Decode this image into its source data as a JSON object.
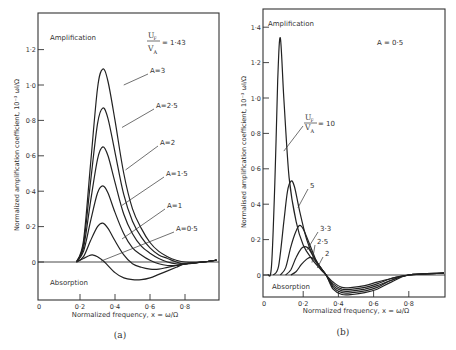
{
  "chart_data": [
    {
      "type": "line",
      "panel_label": "(a)",
      "title": "",
      "xlabel": "Normalized frequency,  x = ω/Ω",
      "ylabel": "Normalized amplification coefficient,  10⁻³ ωI/Ω",
      "xlim": [
        0,
        1.0
      ],
      "ylim": [
        -0.12,
        1.3
      ],
      "xticks": [
        {
          "v": 0,
          "label": "0"
        },
        {
          "v": 0.2,
          "label": "0·2"
        },
        {
          "v": 0.4,
          "label": "0·4"
        },
        {
          "v": 0.6,
          "label": "0·6"
        },
        {
          "v": 0.8,
          "label": "0·8"
        }
      ],
      "yticks": [
        {
          "v": 0,
          "label": "0"
        },
        {
          "v": 0.2,
          "label": "0·2"
        },
        {
          "v": 0.4,
          "label": "0·4"
        },
        {
          "v": 0.6,
          "label": "0·6"
        },
        {
          "v": 0.8,
          "label": "0·8"
        },
        {
          "v": 1.0,
          "label": "1·0"
        },
        {
          "v": 1.2,
          "label": "1·2"
        }
      ],
      "annotations": {
        "top": "Amplification",
        "bottom": "Absorption",
        "param_num": "U",
        "param_num_sub": "F",
        "param_den": "V",
        "param_den_sub": "A",
        "param_value": "= 1·43"
      },
      "series": [
        {
          "name": "A = 3",
          "label": "A=3",
          "peak": 1.09,
          "peak_x": 0.33,
          "x": [
            0.18,
            0.22,
            0.26,
            0.3,
            0.33,
            0.36,
            0.4,
            0.45,
            0.5,
            0.55,
            0.6,
            0.65,
            0.7,
            0.75,
            0.8,
            0.9,
            0.98
          ],
          "y": [
            0,
            0.12,
            0.55,
            0.98,
            1.09,
            1.02,
            0.8,
            0.5,
            0.3,
            0.19,
            0.11,
            0.06,
            0.03,
            0.01,
            0.0,
            0.0,
            0.01
          ]
        },
        {
          "name": "A = 2.5",
          "label": "A=2·5",
          "peak": 0.87,
          "peak_x": 0.33,
          "x": [
            0.18,
            0.22,
            0.26,
            0.3,
            0.33,
            0.36,
            0.4,
            0.45,
            0.5,
            0.55,
            0.6,
            0.65,
            0.7,
            0.75,
            0.8,
            0.9,
            0.98
          ],
          "y": [
            0,
            0.1,
            0.45,
            0.78,
            0.87,
            0.81,
            0.62,
            0.38,
            0.23,
            0.14,
            0.08,
            0.04,
            0.02,
            0.0,
            -0.01,
            0.0,
            0.01
          ]
        },
        {
          "name": "A = 2",
          "label": "A=2",
          "peak": 0.65,
          "peak_x": 0.33,
          "x": [
            0.18,
            0.22,
            0.26,
            0.3,
            0.33,
            0.36,
            0.4,
            0.45,
            0.5,
            0.55,
            0.6,
            0.65,
            0.7,
            0.75,
            0.8,
            0.9,
            0.98
          ],
          "y": [
            0,
            0.08,
            0.34,
            0.58,
            0.65,
            0.6,
            0.45,
            0.27,
            0.16,
            0.09,
            0.05,
            0.02,
            0.0,
            -0.01,
            -0.01,
            0.0,
            0.01
          ]
        },
        {
          "name": "A = 1.5",
          "label": "A=1·5",
          "peak": 0.43,
          "peak_x": 0.33,
          "x": [
            0.18,
            0.22,
            0.26,
            0.3,
            0.33,
            0.36,
            0.4,
            0.45,
            0.5,
            0.55,
            0.6,
            0.65,
            0.7,
            0.75,
            0.8,
            0.9,
            0.98
          ],
          "y": [
            0,
            0.06,
            0.23,
            0.39,
            0.43,
            0.39,
            0.28,
            0.16,
            0.08,
            0.04,
            0.01,
            -0.01,
            -0.02,
            -0.02,
            -0.01,
            0.0,
            0.01
          ]
        },
        {
          "name": "A = 1",
          "label": "A=1",
          "peak": 0.22,
          "peak_x": 0.33,
          "x": [
            0.18,
            0.22,
            0.26,
            0.3,
            0.33,
            0.36,
            0.4,
            0.45,
            0.5,
            0.55,
            0.6,
            0.65,
            0.7,
            0.75,
            0.8,
            0.9,
            0.98
          ],
          "y": [
            0,
            0.03,
            0.12,
            0.2,
            0.22,
            0.19,
            0.12,
            0.04,
            -0.01,
            -0.03,
            -0.04,
            -0.04,
            -0.03,
            -0.02,
            -0.01,
            0.0,
            0.01
          ]
        },
        {
          "name": "A = 0.5",
          "label": "A=0·5",
          "peak": 0.04,
          "peak_x": 0.27,
          "x": [
            0.18,
            0.22,
            0.25,
            0.27,
            0.3,
            0.34,
            0.4,
            0.45,
            0.5,
            0.55,
            0.6,
            0.65,
            0.7,
            0.75,
            0.8,
            0.9,
            0.98
          ],
          "y": [
            0,
            0.02,
            0.035,
            0.04,
            0.03,
            0.0,
            -0.06,
            -0.09,
            -0.1,
            -0.1,
            -0.09,
            -0.07,
            -0.05,
            -0.03,
            -0.01,
            0.0,
            0.01
          ]
        }
      ]
    },
    {
      "type": "line",
      "panel_label": "(b)",
      "title": "",
      "xlabel": "Normalized frequency,  x = ω/Ω",
      "ylabel": "Normalised amplification coefficient,  10⁻³ ωI/Ω",
      "xlim": [
        0,
        1.0
      ],
      "ylim": [
        -0.12,
        1.5
      ],
      "xticks": [
        {
          "v": 0,
          "label": "0"
        },
        {
          "v": 0.2,
          "label": "0·2"
        },
        {
          "v": 0.4,
          "label": "0·4"
        },
        {
          "v": 0.6,
          "label": "0·6"
        },
        {
          "v": 0.8,
          "label": "0·8"
        }
      ],
      "yticks": [
        {
          "v": 0,
          "label": "0"
        },
        {
          "v": 0.2,
          "label": "0·2"
        },
        {
          "v": 0.4,
          "label": "0·4"
        },
        {
          "v": 0.6,
          "label": "0·6"
        },
        {
          "v": 0.8,
          "label": "0·8"
        },
        {
          "v": 1.0,
          "label": "1·0"
        },
        {
          "v": 1.2,
          "label": "1·2"
        },
        {
          "v": 1.4,
          "label": "1·4"
        }
      ],
      "annotations": {
        "top": "Amplification",
        "bottom": "Absorption",
        "fixed_param": "A = 0·5",
        "param_num": "U",
        "param_num_sub": "F",
        "param_den": "V",
        "param_den_sub": "A",
        "param_value": "= 10"
      },
      "series": [
        {
          "name": "UF/VA = 10",
          "label": "",
          "peak": 1.34,
          "peak_x": 0.07,
          "x": [
            0.0,
            0.02,
            0.04,
            0.055,
            0.07,
            0.09,
            0.12,
            0.16,
            0.2,
            0.25,
            0.3,
            0.33,
            0.37,
            0.42,
            0.48,
            0.55,
            0.62,
            0.7,
            0.8,
            1.0
          ],
          "y": [
            0,
            0.05,
            0.55,
            1.1,
            1.34,
            1.0,
            0.55,
            0.3,
            0.17,
            0.09,
            0.03,
            0.0,
            -0.04,
            -0.07,
            -0.07,
            -0.06,
            -0.04,
            -0.02,
            0.0,
            0.01
          ]
        },
        {
          "name": "UF/VA = 5",
          "label": "5",
          "peak": 0.53,
          "peak_x": 0.13,
          "x": [
            0.03,
            0.06,
            0.09,
            0.11,
            0.13,
            0.15,
            0.18,
            0.22,
            0.26,
            0.3,
            0.33,
            0.37,
            0.42,
            0.48,
            0.55,
            0.62,
            0.7,
            0.8,
            1.0
          ],
          "y": [
            0,
            0.05,
            0.3,
            0.47,
            0.53,
            0.5,
            0.36,
            0.2,
            0.1,
            0.04,
            0.0,
            -0.05,
            -0.08,
            -0.08,
            -0.07,
            -0.05,
            -0.02,
            0.0,
            0.01
          ]
        },
        {
          "name": "UF/VA = 3.3",
          "label": "3·3",
          "peak": 0.28,
          "peak_x": 0.18,
          "x": [
            0.07,
            0.1,
            0.13,
            0.16,
            0.18,
            0.2,
            0.23,
            0.27,
            0.3,
            0.33,
            0.37,
            0.42,
            0.48,
            0.55,
            0.62,
            0.7,
            0.8,
            1.0
          ],
          "y": [
            0,
            0.04,
            0.16,
            0.25,
            0.28,
            0.26,
            0.19,
            0.09,
            0.04,
            0.0,
            -0.06,
            -0.09,
            -0.09,
            -0.08,
            -0.06,
            -0.03,
            0.0,
            0.01
          ]
        },
        {
          "name": "UF/VA = 2.5",
          "label": "2·5",
          "peak": 0.16,
          "peak_x": 0.21,
          "x": [
            0.1,
            0.13,
            0.16,
            0.19,
            0.21,
            0.23,
            0.26,
            0.3,
            0.33,
            0.37,
            0.42,
            0.48,
            0.55,
            0.62,
            0.7,
            0.8,
            1.0
          ],
          "y": [
            0,
            0.03,
            0.1,
            0.15,
            0.16,
            0.15,
            0.1,
            0.04,
            0.0,
            -0.07,
            -0.1,
            -0.1,
            -0.09,
            -0.07,
            -0.03,
            0.0,
            0.01
          ]
        },
        {
          "name": "UF/VA = 2",
          "label": "2",
          "peak": 0.1,
          "peak_x": 0.24,
          "x": [
            0.13,
            0.16,
            0.19,
            0.22,
            0.24,
            0.26,
            0.29,
            0.33,
            0.37,
            0.42,
            0.48,
            0.55,
            0.62,
            0.7,
            0.8,
            1.0
          ],
          "y": [
            0,
            0.02,
            0.06,
            0.09,
            0.1,
            0.09,
            0.05,
            0.0,
            -0.08,
            -0.11,
            -0.11,
            -0.1,
            -0.08,
            -0.04,
            0.0,
            0.01
          ]
        }
      ]
    }
  ]
}
